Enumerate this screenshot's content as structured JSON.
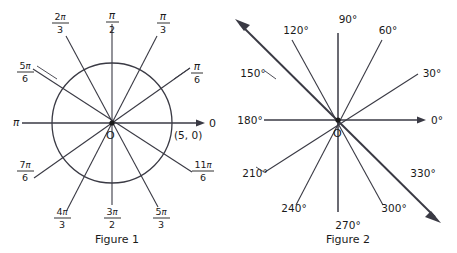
{
  "figure1": {
    "caption": "Figure 1",
    "origin_label": "O",
    "axis_end_label": "0",
    "point_label": "(5, 0)",
    "pi_label": "π",
    "radius_value": 5,
    "circle_center": {
      "x": 112,
      "y": 123
    },
    "circle_radius": 60,
    "angle_labels": [
      {
        "name": "pi-over-6",
        "numerator": "π",
        "denominator": "6",
        "degrees": 30,
        "value": "π/6"
      },
      {
        "name": "pi-over-3",
        "numerator": "π",
        "denominator": "3",
        "degrees": 60,
        "value": "π/3"
      },
      {
        "name": "pi-over-2",
        "numerator": "π",
        "denominator": "2",
        "degrees": 90,
        "value": "π/2"
      },
      {
        "name": "two-pi-over-3",
        "numerator": "2π",
        "denominator": "3",
        "degrees": 120,
        "value": "2π/3"
      },
      {
        "name": "five-pi-over-6",
        "numerator": "5π",
        "denominator": "6",
        "degrees": 150,
        "value": "5π/6"
      },
      {
        "name": "pi",
        "numerator": "π",
        "denominator": "",
        "degrees": 180,
        "value": "π"
      },
      {
        "name": "seven-pi-over-6",
        "numerator": "7π",
        "denominator": "6",
        "degrees": 210,
        "value": "7π/6"
      },
      {
        "name": "four-pi-over-3",
        "numerator": "4π",
        "denominator": "3",
        "degrees": 240,
        "value": "4π/3"
      },
      {
        "name": "three-pi-over-2",
        "numerator": "3π",
        "denominator": "2",
        "degrees": 270,
        "value": "3π/2"
      },
      {
        "name": "five-pi-over-3",
        "numerator": "5π",
        "denominator": "3",
        "degrees": 300,
        "value": "5π/3"
      },
      {
        "name": "eleven-pi-over-6",
        "numerator": "11π",
        "denominator": "6",
        "degrees": 330,
        "value": "11π/6"
      },
      {
        "name": "zero",
        "numerator": "0",
        "denominator": "",
        "degrees": 0,
        "value": "0"
      }
    ]
  },
  "figure2": {
    "caption": "Figure 2",
    "origin_label": "O",
    "center": {
      "x": 338,
      "y": 120
    },
    "angle_labels": [
      {
        "name": "deg-0",
        "text": "0°",
        "degrees": 0
      },
      {
        "name": "deg-30",
        "text": "30°",
        "degrees": 30
      },
      {
        "name": "deg-60",
        "text": "60°",
        "degrees": 60
      },
      {
        "name": "deg-90",
        "text": "90°",
        "degrees": 90
      },
      {
        "name": "deg-120",
        "text": "120°",
        "degrees": 120
      },
      {
        "name": "deg-150",
        "text": "150°",
        "degrees": 150
      },
      {
        "name": "deg-180",
        "text": "180°",
        "degrees": 180
      },
      {
        "name": "deg-210",
        "text": "210°",
        "degrees": 210
      },
      {
        "name": "deg-240",
        "text": "240°",
        "degrees": 240
      },
      {
        "name": "deg-270",
        "text": "270°",
        "degrees": 270
      },
      {
        "name": "deg-300",
        "text": "300°",
        "degrees": 300
      },
      {
        "name": "deg-330",
        "text": "330°",
        "degrees": 330
      }
    ]
  },
  "colors": {
    "ink": "#1a1a1a",
    "line": "#3a3a44",
    "background": "#ffffff"
  }
}
